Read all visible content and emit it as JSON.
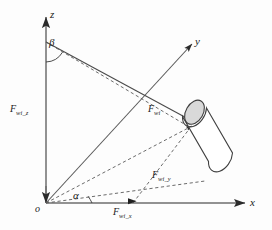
{
  "figure": {
    "background_color": "#fdfdfd",
    "line_color": "#3a3a3a",
    "cylinder_fill": "#ffffff",
    "cylinder_cap_fill": "#d9d9d9"
  },
  "axes": {
    "z": {
      "label": "z"
    },
    "y": {
      "label": "y"
    },
    "x": {
      "label": "x"
    },
    "origin": {
      "label": "o"
    }
  },
  "angles": {
    "alpha": {
      "label": "α"
    },
    "beta": {
      "label": "β"
    }
  },
  "forces": {
    "resultant": {
      "symbol": "F",
      "subscript": "wi"
    },
    "z_component": {
      "symbol": "F",
      "subscript": "wi_z"
    },
    "y_component": {
      "symbol": "F",
      "subscript": "wi_y"
    },
    "x_component": {
      "symbol": "F",
      "subscript": "wi_x"
    }
  },
  "object": {
    "name": "cylinder"
  }
}
